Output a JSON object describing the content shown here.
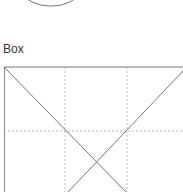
{
  "section": {
    "label": "Box"
  },
  "colors": {
    "stroke": "#777777",
    "grid": "#bbbbbb"
  }
}
